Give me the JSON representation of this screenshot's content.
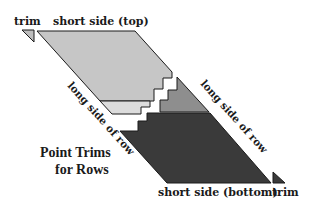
{
  "diagram": {
    "title_line1": "Point Trims",
    "title_line2": "for Rows",
    "labels": {
      "trim_top": "trim",
      "short_side_top": "short side (top)",
      "long_side_left": "long side of row",
      "long_side_right": "long side of row",
      "short_side_bottom": "short side (bottom)",
      "trim_bottom": "trim"
    },
    "colors": {
      "top_region": "#c6c6c6",
      "light_band": "#dcdcdc",
      "mid_region": "#8e8e8e",
      "dark_region": "#3a3a3a",
      "outline": "#1a1a1a"
    }
  }
}
